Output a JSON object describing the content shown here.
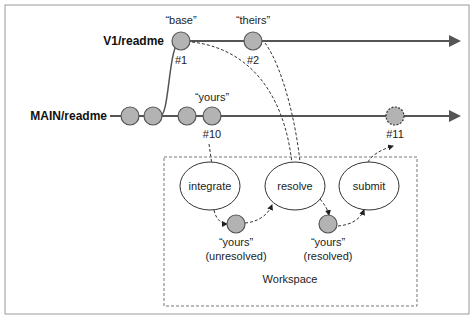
{
  "branches": {
    "v1": {
      "label": "V1/readme"
    },
    "main": {
      "label": "MAIN/readme"
    }
  },
  "revisions": {
    "base": {
      "quote": "“base”",
      "num": "#1"
    },
    "theirs": {
      "quote": "“theirs”",
      "num": "#2"
    },
    "yours": {
      "quote": "“yours”",
      "num": "#10"
    },
    "new": {
      "num": "#11"
    }
  },
  "workspace": {
    "label": "Workspace",
    "steps": [
      "integrate",
      "resolve",
      "submit"
    ],
    "unresolved": {
      "quote": "“yours”",
      "state": "(unresolved)"
    },
    "resolved": {
      "quote": "“yours”",
      "state": "(resolved)"
    }
  },
  "colors": {
    "node_fill": "#b3b3b3",
    "line": "#555555",
    "border": "#9a9a9a"
  }
}
